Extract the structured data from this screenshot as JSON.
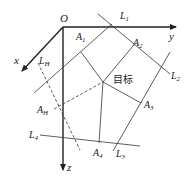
{
  "diagram": {
    "origin": {
      "label": "O",
      "x": 63,
      "y": 27
    },
    "axes": [
      {
        "name": "x",
        "label": "x",
        "from": [
          63,
          27
        ],
        "to": [
          21,
          72
        ]
      },
      {
        "name": "y",
        "label": "y",
        "from": [
          63,
          27
        ],
        "to": [
          178,
          27
        ]
      },
      {
        "name": "z",
        "label": "z",
        "from": [
          63,
          27
        ],
        "to": [
          63,
          170
        ]
      }
    ],
    "labels": {
      "O": "O",
      "x": "x",
      "y": "y",
      "z": "z",
      "L1": "L",
      "L1_sub": "1",
      "L2": "L",
      "L2_sub": "2",
      "L3": "L",
      "L3_sub": "3",
      "L4": "L",
      "L4_sub": "4",
      "LH": "L",
      "LH_sub": "H",
      "A1": "A",
      "A1_sub": "1",
      "A2": "A",
      "A2_sub": "2",
      "A3": "A",
      "A3_sub": "3",
      "A4": "A",
      "A4_sub": "4",
      "AH": "A",
      "AH_sub": "H",
      "target": "目标"
    },
    "colors": {
      "line": "#333333",
      "background": "#ffffff"
    }
  }
}
